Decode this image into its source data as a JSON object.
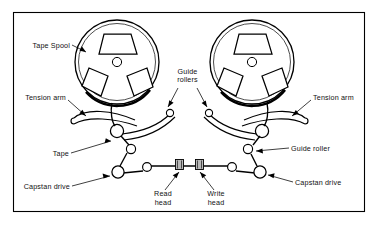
{
  "figure": {
    "background_color": "#ffffff",
    "line_color": "#000000",
    "head_fill_color": "#b9b9b9",
    "width": 378,
    "height": 227
  },
  "labels": {
    "tape_spool": "Tape Spool",
    "tension_arm_left": "Tension arm",
    "tension_arm_right": "Tension arm",
    "guide_rollers_line1": "Guide",
    "guide_rollers_line2": "rollers",
    "tape": "Tape",
    "guide_roller_right": "Guide roller",
    "capstan_drive_left": "Capstan drive",
    "capstan_drive_right": "Capstan drive",
    "read_head_line1": "Read",
    "read_head_line2": "head",
    "write_head_line1": "Write",
    "write_head_line2": "head"
  },
  "components": {
    "spools": [
      {
        "name": "left-tape-spool",
        "cx": 117,
        "cy": 62,
        "r": 42,
        "hub_r": 4.5,
        "cutouts": 3
      },
      {
        "name": "right-tape-spool",
        "cx": 252,
        "cy": 62,
        "r": 42,
        "hub_r": 4.5,
        "cutouts": 3
      }
    ],
    "rollers": [
      {
        "name": "left-tension-pivot",
        "cx": 117,
        "cy": 131,
        "r": 6.5
      },
      {
        "name": "left-guide-roller",
        "cx": 147,
        "cy": 123,
        "r": 4.0
      },
      {
        "name": "left-lower-roller",
        "cx": 130,
        "cy": 149,
        "r": 4.5
      },
      {
        "name": "left-capstan-drive",
        "cx": 118,
        "cy": 172,
        "r": 6.0
      },
      {
        "name": "left-head-roller",
        "cx": 146,
        "cy": 170,
        "r": 4.5
      },
      {
        "name": "right-tension-pivot",
        "cx": 262,
        "cy": 131,
        "r": 6.5
      },
      {
        "name": "right-guide-roller",
        "cx": 252,
        "cy": 149,
        "r": 4.5
      },
      {
        "name": "right-capstan-drive",
        "cx": 259,
        "cy": 172,
        "r": 6.0
      },
      {
        "name": "right-head-roller",
        "cx": 233,
        "cy": 170,
        "r": 4.5
      }
    ],
    "heads": [
      {
        "name": "read-head",
        "x": 176,
        "y": 159,
        "w": 8,
        "h": 10
      },
      {
        "name": "write-head",
        "x": 196,
        "y": 159,
        "w": 8,
        "h": 10
      }
    ],
    "frame": {
      "x": 13,
      "y": 12,
      "w": 352,
      "h": 200
    }
  }
}
